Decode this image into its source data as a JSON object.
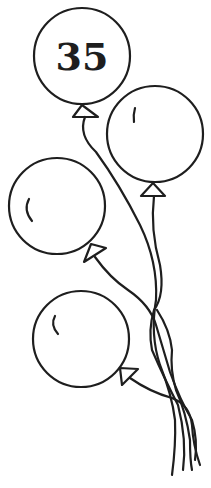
{
  "illustration": {
    "subject": "bunch of four balloons on strings",
    "style": "black line art on white",
    "colors": {
      "line": "#1e1e1e",
      "background": "#ffffff"
    },
    "balloons": [
      {
        "id": "top",
        "label": "35",
        "cx": 82,
        "cy": 56,
        "r": 48
      },
      {
        "id": "right",
        "label": "",
        "cx": 155,
        "cy": 134,
        "r": 48
      },
      {
        "id": "left",
        "label": "",
        "cx": 57,
        "cy": 206,
        "r": 48
      },
      {
        "id": "bottom",
        "label": "",
        "cx": 81,
        "cy": 339,
        "r": 48
      }
    ]
  }
}
